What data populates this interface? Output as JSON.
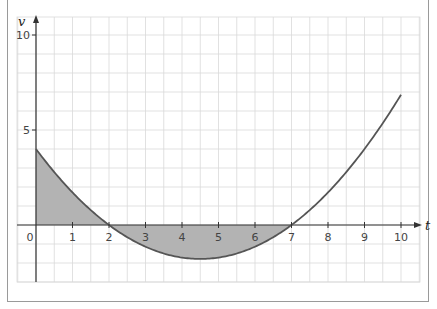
{
  "chart_data": {
    "type": "line",
    "title": "",
    "xlabel": "t",
    "ylabel": "v",
    "xlim": [
      -0.5,
      10.6
    ],
    "ylim": [
      -3.0,
      11.0
    ],
    "grid": true,
    "x_ticks": [
      0,
      1,
      2,
      3,
      4,
      5,
      6,
      7,
      8,
      9,
      10
    ],
    "x_tick_labels": [
      "0",
      "1",
      "2",
      "3",
      "4",
      "5",
      "6",
      "7",
      "8",
      "9",
      "10"
    ],
    "y_ticks": [
      5,
      10
    ],
    "y_tick_labels": [
      "5",
      "10"
    ],
    "series": [
      {
        "name": "v(t)",
        "description": "parabola v = (2/7)(t-2)(t-7)",
        "x": [
          0,
          0.5,
          1,
          1.5,
          2,
          2.5,
          3,
          3.5,
          4,
          4.5,
          5,
          5.5,
          6,
          6.5,
          7,
          7.5,
          8,
          8.5,
          9,
          9.5,
          10
        ],
        "y": [
          4.0,
          3.21,
          2.57,
          1.93,
          0.0,
          -0.64,
          -1.14,
          -1.5,
          -1.71,
          -1.79,
          -1.71,
          -1.5,
          -1.14,
          -0.64,
          0.0,
          0.79,
          1.71,
          2.79,
          4.0,
          5.36,
          6.86
        ]
      }
    ],
    "shaded_regions": [
      {
        "from": 0,
        "to": 2,
        "label": "area above axis"
      },
      {
        "from": 2,
        "to": 7,
        "label": "area below axis"
      }
    ],
    "colors": {
      "curve": "#555555",
      "shade": "#b3b3b3",
      "grid": "#d9d9d9",
      "axis": "#333333"
    }
  }
}
